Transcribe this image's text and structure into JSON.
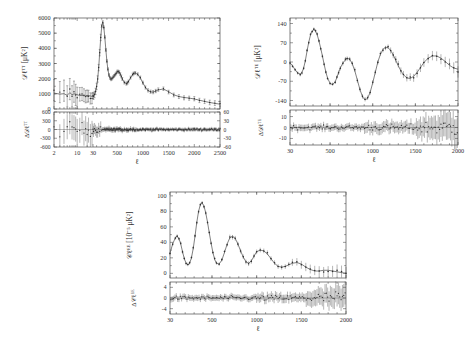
{
  "figure": {
    "background": "#ffffff",
    "curve_color": "#555555",
    "point_color": "#2e2e2e"
  },
  "chart_data": [
    {
      "id": "tt",
      "type": "line",
      "title": "",
      "xlabel": "ℓ",
      "ylabel": "D_ℓ^{TT} [μK²]",
      "ylabel_main": "𝒟",
      "xscale": "hybrid-log-linear",
      "xlim": [
        2,
        2500
      ],
      "ylim": [
        0,
        6000
      ],
      "xticks": [
        2,
        10,
        30,
        500,
        1000,
        1500,
        2000,
        2500
      ],
      "yticks": [
        0,
        1000,
        2000,
        3000,
        4000,
        5000,
        6000
      ],
      "grid": false,
      "legend": "none",
      "x": [
        2,
        3,
        4,
        5,
        6,
        7,
        8,
        9,
        10,
        12,
        14,
        16,
        18,
        20,
        22,
        25,
        28,
        30,
        40,
        60,
        80,
        100,
        120,
        140,
        160,
        180,
        200,
        220,
        240,
        260,
        280,
        300,
        320,
        340,
        360,
        380,
        400,
        420,
        440,
        460,
        480,
        500,
        520,
        540,
        560,
        580,
        600,
        640,
        680,
        700,
        720,
        760,
        800,
        820,
        850,
        900,
        950,
        1000,
        1050,
        1100,
        1150,
        1200,
        1250,
        1300,
        1400,
        1500,
        1600,
        1700,
        1800,
        1900,
        2000,
        2100,
        2200,
        2300,
        2400,
        2500
      ],
      "values": [
        1050,
        980,
        1010,
        900,
        1080,
        940,
        1000,
        980,
        950,
        880,
        900,
        870,
        860,
        900,
        880,
        860,
        830,
        820,
        850,
        960,
        1150,
        1480,
        1950,
        2700,
        3700,
        4700,
        5480,
        5720,
        5400,
        4700,
        3900,
        3150,
        2600,
        2250,
        2050,
        1980,
        2000,
        2080,
        2180,
        2280,
        2380,
        2450,
        2470,
        2420,
        2300,
        2150,
        1980,
        1750,
        1680,
        1720,
        1820,
        2050,
        2270,
        2350,
        2380,
        2280,
        2050,
        1720,
        1420,
        1220,
        1120,
        1120,
        1180,
        1260,
        1320,
        1140,
        940,
        820,
        760,
        720,
        660,
        580,
        500,
        430,
        370,
        320
      ],
      "residual": {
        "ylabel": "ΔD_ℓ^{TT}",
        "yticks_left": [
          -600,
          -300,
          0,
          300,
          600
        ],
        "yticks_right": [
          -60,
          -30,
          0,
          30,
          60
        ],
        "ylim": [
          -600,
          600
        ]
      }
    },
    {
      "id": "te",
      "type": "line",
      "title": "",
      "xlabel": "ℓ",
      "ylabel": "D_ℓ^{TE} [μK²]",
      "xscale": "linear",
      "xlim": [
        30,
        2000
      ],
      "ylim": [
        -160,
        160
      ],
      "xticks": [
        30,
        500,
        1000,
        1500,
        2000
      ],
      "yticks": [
        -140,
        -70,
        0,
        70,
        140
      ],
      "grid": false,
      "legend": "none",
      "x": [
        30,
        60,
        90,
        120,
        150,
        170,
        190,
        210,
        230,
        250,
        270,
        290,
        310,
        330,
        350,
        370,
        390,
        410,
        430,
        450,
        470,
        500,
        530,
        560,
        580,
        600,
        620,
        650,
        680,
        700,
        730,
        760,
        790,
        820,
        850,
        880,
        910,
        940,
        970,
        1000,
        1030,
        1060,
        1090,
        1120,
        1150,
        1180,
        1210,
        1240,
        1270,
        1300,
        1330,
        1360,
        1400,
        1440,
        1480,
        1520,
        1560,
        1600,
        1650,
        1700,
        1750,
        1800,
        1850,
        1900,
        1950,
        2000
      ],
      "values": [
        -3,
        -14,
        -28,
        -40,
        -44,
        -38,
        -22,
        5,
        40,
        72,
        98,
        112,
        118,
        112,
        98,
        76,
        50,
        22,
        -8,
        -36,
        -58,
        -78,
        -82,
        -72,
        -56,
        -38,
        -22,
        -4,
        8,
        14,
        10,
        -6,
        -32,
        -66,
        -100,
        -126,
        -138,
        -132,
        -110,
        -76,
        -38,
        0,
        28,
        46,
        54,
        52,
        42,
        26,
        6,
        -14,
        -32,
        -46,
        -58,
        -60,
        -52,
        -38,
        -20,
        -2,
        14,
        22,
        22,
        14,
        2,
        -12,
        -22,
        -26
      ],
      "residual": {
        "ylabel": "ΔD_ℓ^{TE}",
        "yticks": [
          -10,
          0,
          10
        ],
        "ylim": [
          -16,
          16
        ]
      }
    },
    {
      "id": "ee",
      "type": "line",
      "title": "",
      "xlabel": "ℓ",
      "ylabel": "C_ℓ^{EE} [10⁻⁵ μK²]",
      "xscale": "linear",
      "xlim": [
        30,
        2000
      ],
      "ylim": [
        -6,
        105
      ],
      "xticks": [
        30,
        500,
        1000,
        1500,
        2000
      ],
      "yticks": [
        0,
        20,
        40,
        60,
        80,
        100
      ],
      "grid": false,
      "legend": "none",
      "x": [
        30,
        60,
        90,
        110,
        130,
        150,
        170,
        190,
        210,
        230,
        250,
        270,
        290,
        310,
        330,
        350,
        370,
        390,
        410,
        430,
        450,
        470,
        490,
        510,
        530,
        550,
        580,
        610,
        640,
        670,
        700,
        730,
        760,
        790,
        820,
        850,
        880,
        910,
        940,
        970,
        1000,
        1040,
        1080,
        1120,
        1160,
        1200,
        1240,
        1280,
        1320,
        1360,
        1400,
        1450,
        1500,
        1550,
        1600,
        1650,
        1700,
        1750,
        1800,
        1850,
        1900,
        1950,
        2000
      ],
      "values": [
        26,
        38,
        46,
        48,
        45,
        38,
        28,
        19,
        13,
        11,
        13,
        20,
        32,
        48,
        66,
        80,
        89,
        91,
        87,
        78,
        66,
        52,
        39,
        27,
        18,
        13,
        12,
        17,
        27,
        38,
        46,
        48,
        45,
        38,
        29,
        21,
        15,
        13,
        16,
        22,
        28,
        30,
        29,
        25,
        19,
        13,
        9,
        8,
        9,
        11,
        13,
        14,
        12,
        8,
        5,
        3,
        3,
        4,
        4,
        3,
        2,
        1,
        0
      ],
      "residual": {
        "ylabel": "ΔC_ℓ^{EE}",
        "yticks": [
          -4,
          0,
          4
        ],
        "ylim": [
          -6,
          6
        ]
      }
    }
  ]
}
